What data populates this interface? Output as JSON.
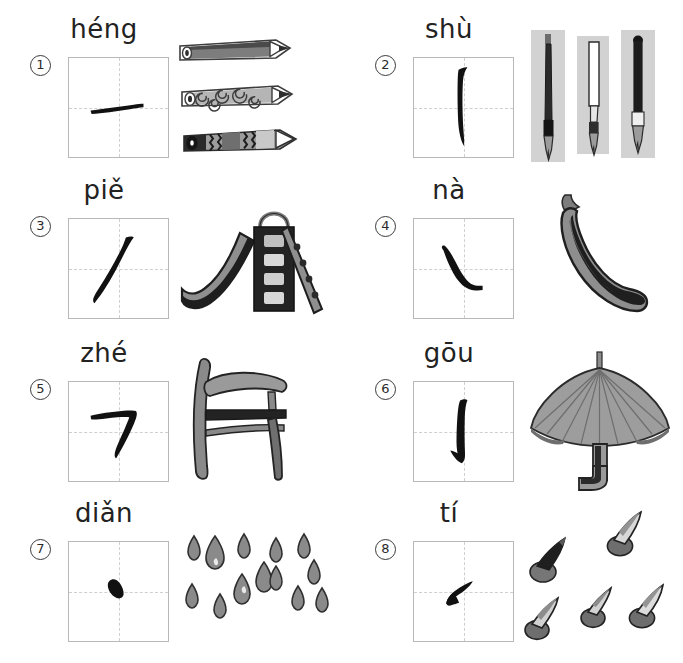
{
  "page": {
    "background_color": "#ffffff",
    "stroke_ink_color": "#111111",
    "grid_border_color": "#b6b8ba",
    "grid_guide_color": "#cfcfcf",
    "illustration_gray": "#9a9a9a",
    "illustration_dark": "#3d3d3d",
    "columns": 2,
    "rows": 4
  },
  "cells": [
    {
      "number": "1",
      "pinyin": "héng",
      "stroke_name": "heng",
      "stroke_glyph": "一",
      "illustration": "pencils",
      "illustration_count": "3"
    },
    {
      "number": "2",
      "pinyin": "shù",
      "stroke_name": "shu",
      "stroke_glyph": "丨",
      "illustration": "brush-pens",
      "illustration_count": "3"
    },
    {
      "number": "3",
      "pinyin": "piě",
      "stroke_name": "pie",
      "stroke_glyph": "丿",
      "illustration": "playground-slide",
      "illustration_count": "1"
    },
    {
      "number": "4",
      "pinyin": "nà",
      "stroke_name": "na",
      "stroke_glyph": "㇏",
      "illustration": "chili-pepper",
      "illustration_count": "1"
    },
    {
      "number": "5",
      "pinyin": "zhé",
      "stroke_name": "zhe",
      "stroke_glyph": "㇕",
      "illustration": "chair",
      "illustration_count": "1"
    },
    {
      "number": "6",
      "pinyin": "gōu",
      "stroke_name": "gou",
      "stroke_glyph": "亅",
      "illustration": "umbrella",
      "illustration_count": "1"
    },
    {
      "number": "7",
      "pinyin": "diǎn",
      "stroke_name": "dian",
      "stroke_glyph": "丶",
      "illustration": "raindrops",
      "illustration_count": "13"
    },
    {
      "number": "8",
      "pinyin": "tí",
      "stroke_name": "ti",
      "stroke_glyph": "㇀",
      "illustration": "pushpins",
      "illustration_count": "5"
    }
  ]
}
